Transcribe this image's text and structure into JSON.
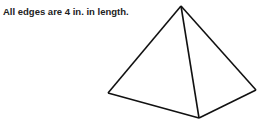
{
  "caption": "All edges are 4 in. in length.",
  "figure": {
    "type": "square-pyramid",
    "stroke_color": "#111111",
    "vertices": {
      "apex": [
        181,
        6
      ],
      "left": [
        108,
        93
      ],
      "front": [
        199,
        118
      ],
      "right": [
        256,
        90
      ]
    },
    "edge_length": "4 in."
  }
}
